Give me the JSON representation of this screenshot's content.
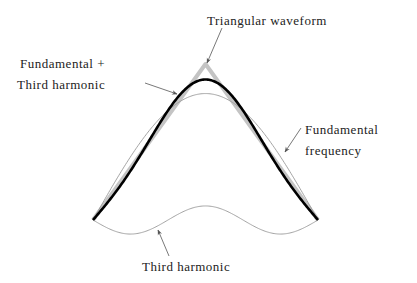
{
  "diagram": {
    "labels": {
      "triangular": "Triangular waveform",
      "sum_line1": "Fundamental +",
      "sum_line2": "Third harmonic",
      "fundamental_line1": "Fundamental",
      "fundamental_line2": "frequency",
      "third": "Third harmonic"
    },
    "colors": {
      "triangular": "#c4c4c4",
      "sum": "#000000",
      "fundamental": "#9a9a9a",
      "third": "#9a9a9a",
      "text": "#222222",
      "arrow": "#555555"
    }
  },
  "chart_data": {
    "type": "line",
    "title": "",
    "xlabel": "",
    "ylabel": "",
    "grid": false,
    "series": [
      {
        "name": "Triangular waveform",
        "points": [
          [
            0,
            0
          ],
          [
            0.5,
            1
          ],
          [
            1,
            0
          ]
        ]
      },
      {
        "name": "Fundamental frequency",
        "formula": "(8/pi^2) sin(pi x)"
      },
      {
        "name": "Third harmonic",
        "formula": "-(8/(9 pi^2)) sin(3 pi x)"
      },
      {
        "name": "Fundamental + Third harmonic",
        "formula": "fundamental + third"
      }
    ],
    "xlim": [
      0,
      1
    ],
    "ylim": [
      -0.1,
      1
    ]
  }
}
